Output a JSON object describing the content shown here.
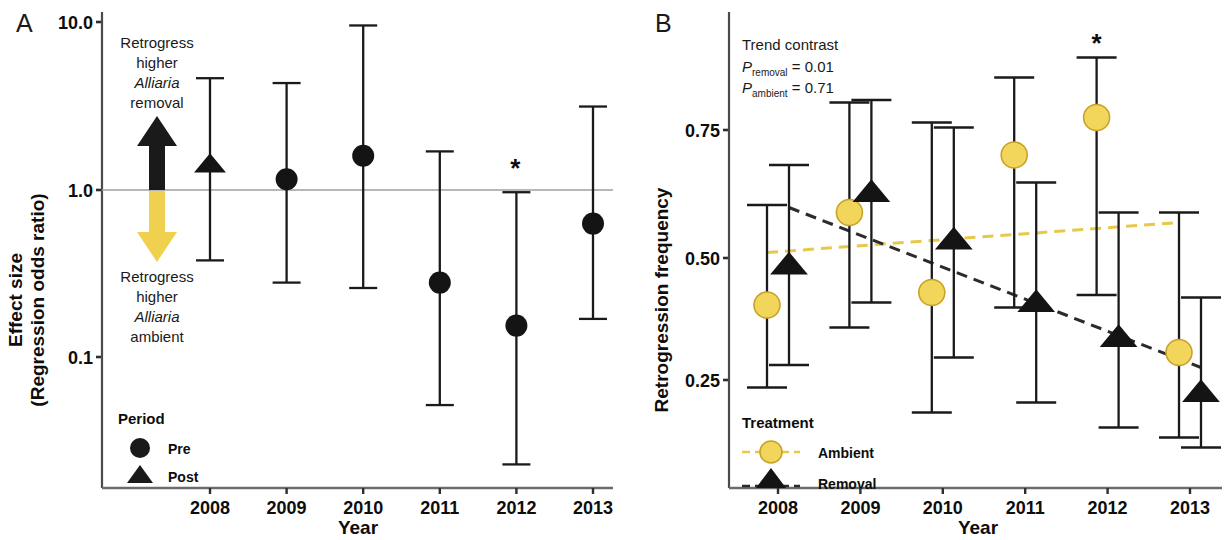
{
  "figure": {
    "width": 1226,
    "height": 540,
    "background": "#ffffff",
    "colors": {
      "black": "#141414",
      "yellow": "#F2D65C",
      "yellow_stroke": "#C9A227",
      "grid": "#9aa0a6",
      "axis": "#3c3c3c"
    }
  },
  "panelA": {
    "letter": "A",
    "ylabel_line1": "Effect size",
    "ylabel_line2": "(Regression odds ratio)",
    "xlabel": "Year",
    "yticks": [
      "10.0",
      "1.0",
      "0.1"
    ],
    "xticks": [
      "2008",
      "2009",
      "2010",
      "2011",
      "2012",
      "2013"
    ],
    "annotation_up": {
      "line1": "Retrogress",
      "line2": "higher",
      "line3": "Alliaria",
      "line4": "removal"
    },
    "annotation_down": {
      "line1": "Retrogress",
      "line2": "higher",
      "line3": "Alliaria",
      "line4": "ambient"
    },
    "legend": {
      "title": "Period",
      "items": [
        {
          "label": "Pre",
          "marker": "circle"
        },
        {
          "label": "Post",
          "marker": "triangle"
        }
      ]
    },
    "significance_marker": "*",
    "significant_years": [
      "2012"
    ]
  },
  "panelB": {
    "letter": "B",
    "ylabel": "Retrogression frequency",
    "xlabel": "Year",
    "yticks": [
      "0.75",
      "0.50",
      "0.25"
    ],
    "xticks": [
      "2008",
      "2009",
      "2010",
      "2011",
      "2012",
      "2013"
    ],
    "annotation": {
      "title": "Trend contrast",
      "p_removal_prefix": "P",
      "p_removal_sub": "removal",
      "p_removal_value": " = 0.01",
      "p_ambient_prefix": "P",
      "p_ambient_sub": "ambient",
      "p_ambient_value": " = 0.71"
    },
    "legend": {
      "title": "Treatment",
      "items": [
        {
          "label": "Ambient",
          "marker": "circle",
          "color": "#F2D65C"
        },
        {
          "label": "Removal",
          "marker": "triangle",
          "color": "#141414"
        }
      ]
    },
    "significance_marker": "*",
    "significant_years": [
      "2012"
    ]
  },
  "chart_data": [
    {
      "type": "scatter",
      "panel": "A",
      "title": "",
      "xlabel": "Year",
      "ylabel": "Effect size (Regression odds ratio)",
      "yscale": "log",
      "ylim": [
        0.02,
        11.0
      ],
      "ytick_values": [
        10.0,
        1.0,
        0.1
      ],
      "ytick_labels": [
        "10.0",
        "1.0",
        "0.1"
      ],
      "x": [
        2008,
        2009,
        2010,
        2011,
        2012,
        2013
      ],
      "reference_line": 1.0,
      "grid": false,
      "legend_position": "lower-left",
      "series": [
        {
          "name": "Post",
          "marker": "triangle",
          "color": "#141414",
          "points": [
            {
              "x": 2008,
              "y": 1.42,
              "lo": 0.38,
              "hi": 4.65
            }
          ]
        },
        {
          "name": "Pre",
          "marker": "circle",
          "color": "#141414",
          "points": [
            {
              "x": 2009,
              "y": 1.16,
              "lo": 0.28,
              "hi": 4.35
            },
            {
              "x": 2010,
              "y": 1.6,
              "lo": 0.26,
              "hi": 9.6
            },
            {
              "x": 2011,
              "y": 0.28,
              "lo": 0.052,
              "hi": 1.7
            },
            {
              "x": 2012,
              "y": 0.155,
              "lo": 0.023,
              "hi": 0.97
            },
            {
              "x": 2013,
              "y": 0.63,
              "lo": 0.17,
              "hi": 3.15
            }
          ]
        }
      ],
      "annotations": [
        {
          "text": "*",
          "x": 2012,
          "y": 1.35
        }
      ]
    },
    {
      "type": "scatter",
      "panel": "B",
      "title": "",
      "xlabel": "Year",
      "ylabel": "Retrogression frequency",
      "yscale": "linear",
      "ylim": [
        0.1,
        0.93
      ],
      "ytick_values": [
        0.75,
        0.5,
        0.25
      ],
      "ytick_labels": [
        "0.75",
        "0.50",
        "0.25"
      ],
      "x": [
        2008,
        2009,
        2010,
        2011,
        2012,
        2013
      ],
      "grid": false,
      "legend_position": "lower-left",
      "series": [
        {
          "name": "Ambient",
          "marker": "circle",
          "color": "#F2D65C",
          "points": [
            {
              "x": 2008,
              "y": 0.4,
              "lo": 0.235,
              "hi": 0.6
            },
            {
              "x": 2009,
              "y": 0.585,
              "lo": 0.355,
              "hi": 0.805
            },
            {
              "x": 2010,
              "y": 0.425,
              "lo": 0.185,
              "hi": 0.765
            },
            {
              "x": 2011,
              "y": 0.7,
              "lo": 0.395,
              "hi": 0.855
            },
            {
              "x": 2012,
              "y": 0.775,
              "lo": 0.42,
              "hi": 0.895
            },
            {
              "x": 2013,
              "y": 0.305,
              "lo": 0.135,
              "hi": 0.585
            }
          ],
          "trend_line": {
            "start_y": 0.505,
            "end_y": 0.565,
            "style": "dashed",
            "color": "#E8C84A"
          }
        },
        {
          "name": "Removal",
          "marker": "triangle",
          "color": "#141414",
          "points": [
            {
              "x": 2008,
              "y": 0.48,
              "lo": 0.28,
              "hi": 0.68
            },
            {
              "x": 2009,
              "y": 0.625,
              "lo": 0.405,
              "hi": 0.81
            },
            {
              "x": 2010,
              "y": 0.53,
              "lo": 0.295,
              "hi": 0.755
            },
            {
              "x": 2011,
              "y": 0.405,
              "lo": 0.205,
              "hi": 0.645
            },
            {
              "x": 2012,
              "y": 0.335,
              "lo": 0.155,
              "hi": 0.585
            },
            {
              "x": 2013,
              "y": 0.225,
              "lo": 0.115,
              "hi": 0.415
            }
          ],
          "trend_line": {
            "start_y": 0.595,
            "end_y": 0.275,
            "style": "dashed",
            "color": "#2b2b2b"
          }
        }
      ],
      "annotations": [
        {
          "text": "*",
          "x": 2012,
          "y": 0.925
        },
        {
          "text": "Trend contrast"
        },
        {
          "text": "P_removal = 0.01"
        },
        {
          "text": "P_ambient = 0.71"
        }
      ]
    }
  ]
}
